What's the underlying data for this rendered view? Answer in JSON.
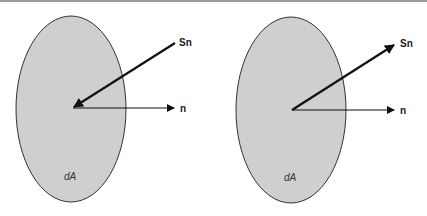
{
  "diagram": {
    "colors": {
      "surface_fill": "#cfcfcf",
      "surface_stroke": "#333333",
      "arrow": "#111111",
      "border_top": "#9a9a9a"
    },
    "panels": [
      {
        "name": "incoming",
        "area_label": "dA",
        "normal_label": "n",
        "vector_label": "Sn",
        "vector_direction": "into surface"
      },
      {
        "name": "outgoing",
        "area_label": "dA",
        "normal_label": "n",
        "vector_label": "Sn",
        "vector_direction": "out of surface"
      }
    ]
  }
}
